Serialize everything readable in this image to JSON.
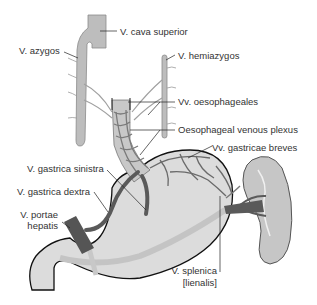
{
  "labels": {
    "vena_cava_superior": "V. cava superior",
    "v_azygos": "V. azygos",
    "v_hemiazygos": "V. hemiazygos",
    "vv_oesophageales": "Vv. oesophageales",
    "oesophageal_plexus": "Oesophageal venous plexus",
    "vv_gastricae_breves": "Vv. gastricae breves",
    "v_gastrica_sinistra": "V. gastrica sinistra",
    "v_gastrica_dextra": "V. gastrica dextra",
    "v_portae_line1": "V. portae",
    "v_portae_line2": "hepatis",
    "v_splenica_line1": "V. splenica",
    "v_splenica_line2": "[lienalis]"
  },
  "colors": {
    "background": "#ffffff",
    "vein_light": "#b8b8b8",
    "vein_dark": "#5a5a5a",
    "organ_fill": "#dcdcdc",
    "outline": "#111111",
    "text": "#333333",
    "leader": "#222222"
  }
}
